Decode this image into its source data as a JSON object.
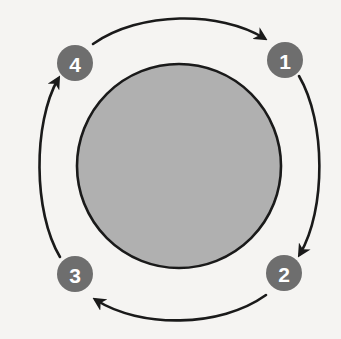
{
  "diagram": {
    "type": "cycle",
    "background_color": "#f5f4f2",
    "core": {
      "label": "",
      "fill_color": "#b0b0b0",
      "stroke_color": "#1a1a1a",
      "center_x": 179,
      "center_y": 166,
      "radius": 102
    },
    "badge_style": {
      "fill_color": "#6e6e6e",
      "text_color": "#ffffff",
      "radius": 18
    },
    "arrow_color": "#1a1a1a",
    "steps": [
      {
        "number": "1",
        "name": "step-one",
        "cx": 285,
        "cy": 60
      },
      {
        "number": "2",
        "name": "step-two",
        "cx": 284,
        "cy": 273
      },
      {
        "number": "3",
        "name": "step-three",
        "cx": 75,
        "cy": 274
      },
      {
        "number": "4",
        "name": "step-four",
        "cx": 75,
        "cy": 63
      }
    ],
    "arrows": [
      {
        "name": "arrow-4-to-1",
        "from": "4",
        "to": "1",
        "position": "top",
        "path": "M 93 44 C 140 11 220 11 264 38"
      },
      {
        "name": "arrow-1-to-2",
        "from": "1",
        "to": "2",
        "position": "right",
        "path": "M 299 76 C 326 122 326 210 300 254"
      },
      {
        "name": "arrow-2-to-3",
        "from": "2",
        "to": "3",
        "position": "bottom",
        "path": "M 266 295 C 220 328 140 328 96 300"
      },
      {
        "name": "arrow-3-to-4",
        "from": "3",
        "to": "4",
        "position": "left",
        "path": "M 60 257 C 33 212 33 123 58 79"
      }
    ]
  }
}
